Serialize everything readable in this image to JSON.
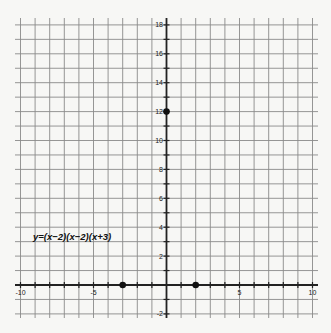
{
  "chart_data": {
    "type": "scatter",
    "title": "",
    "xlabel": "",
    "ylabel": "",
    "xlim": [
      -10.5,
      10.5
    ],
    "ylim": [
      -2.3,
      18.6
    ],
    "grid": true,
    "grid_step": 1,
    "x_ticks": [
      -10,
      -5,
      5,
      10
    ],
    "x_tick_labels": [
      "-10",
      "-5",
      "5",
      "10"
    ],
    "y_ticks": [
      -2,
      2,
      4,
      6,
      8,
      10,
      12,
      14,
      16,
      18
    ],
    "y_tick_labels": [
      "-2",
      "2",
      "4",
      "6",
      "8",
      "10",
      "12",
      "14",
      "16",
      "18"
    ],
    "annotation": "y=(x−2)(x−2)(x+3)",
    "points": [
      {
        "x": 0,
        "y": 12,
        "label": "y-intercept"
      },
      {
        "x": -3,
        "y": 0,
        "label": "x-intercept"
      },
      {
        "x": 2,
        "y": 0,
        "label": "x-intercept"
      }
    ]
  }
}
